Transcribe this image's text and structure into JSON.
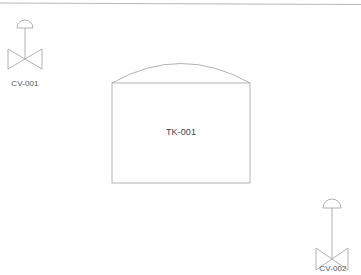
{
  "diagram": {
    "type": "P&ID",
    "colors": {
      "stroke": "#a0a0a0",
      "frame_line": "#b8b8b8",
      "label": "#555555",
      "background": "#ffffff"
    },
    "equipment": [
      {
        "tag": "CV-001",
        "kind": "control-valve",
        "actuator": "diaphragm",
        "label": "CV-001"
      },
      {
        "tag": "TK-001",
        "kind": "tank",
        "roof": "dome",
        "label": "TK-001"
      },
      {
        "tag": "CV-002",
        "kind": "control-valve",
        "actuator": "diaphragm",
        "label": "CV-002"
      }
    ]
  }
}
